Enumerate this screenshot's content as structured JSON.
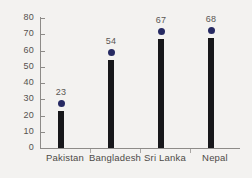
{
  "chart_data": {
    "type": "bar",
    "title": "",
    "subtitle": "",
    "xlabel": "",
    "ylabel": "",
    "categories": [
      "Pakistan",
      "Bangladesh",
      "Sri Lanka",
      "Nepal"
    ],
    "values": [
      23,
      54,
      67,
      68
    ],
    "data_labels": [
      "23",
      "54",
      "67",
      "68"
    ],
    "ylim": [
      0,
      80
    ],
    "yticks": [
      0,
      10,
      20,
      30,
      40,
      50,
      60,
      70,
      80
    ],
    "ytick_labels": [
      "0",
      "10",
      "20",
      "30",
      "40",
      "50",
      "60",
      "70",
      "80"
    ],
    "grid": false,
    "legend": "none",
    "marker": "navy-dot-above-bar",
    "colors": {
      "bar": "#17171a",
      "marker": "#262a62",
      "axis": "#8d8b88",
      "tick_text": "#55514e",
      "value_text": "#5a5653",
      "category_text": "#4d4a47",
      "background": "#f3f2f0"
    }
  }
}
